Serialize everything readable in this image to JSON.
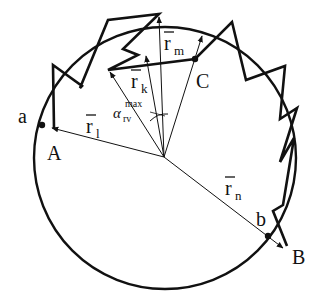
{
  "diagram": {
    "title": "",
    "labels": {
      "a": "a",
      "A": "A",
      "b": "b",
      "B": "B",
      "C": "C",
      "r1": "r",
      "r1_sub": "l",
      "rk": "r",
      "rk_sub": "k",
      "rm": "r",
      "rm_sub": "m",
      "rn": "r",
      "rn_sub": "n",
      "alpha": "α",
      "alpha_sup": "max",
      "alpha_sub": "rv"
    },
    "circle": {
      "cx": 165,
      "cy": 158,
      "r": 131
    },
    "center": {
      "x": 164,
      "y": 157
    },
    "vectors": [
      {
        "name": "r1",
        "to": [
          50,
          128
        ]
      },
      {
        "name": "rk",
        "to": [
          108,
          70
        ]
      },
      {
        "name": "r_mid1",
        "to": [
          134,
          54
        ]
      },
      {
        "name": "r_mid2",
        "to": [
          159,
          16
        ]
      },
      {
        "name": "rm",
        "to": [
          202,
          35
        ]
      },
      {
        "name": "rn",
        "to": [
          282,
          246
        ]
      }
    ],
    "points": {
      "a": [
        42,
        125
      ],
      "C": [
        195,
        59
      ],
      "b": [
        268,
        236
      ]
    },
    "colors": {
      "stroke": "#111111",
      "background": "#ffffff"
    }
  }
}
